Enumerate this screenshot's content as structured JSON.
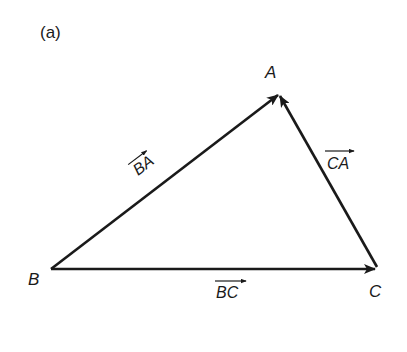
{
  "figure": {
    "panel_label": "(a)",
    "colors": {
      "stroke": "#1a1a1a",
      "background": "#ffffff"
    },
    "vertices": [
      {
        "name": "A",
        "x": 279,
        "y": 94
      },
      {
        "name": "B",
        "x": 51,
        "y": 269
      },
      {
        "name": "C",
        "x": 377,
        "y": 269
      }
    ],
    "vectors": [
      {
        "label": "BA",
        "from": "B",
        "to": "A"
      },
      {
        "label": "CA",
        "from": "C",
        "to": "A"
      },
      {
        "label": "BC",
        "from": "B",
        "to": "C"
      }
    ],
    "labels": {
      "A": "A",
      "B": "B",
      "C": "C",
      "BA": "BA",
      "CA": "CA",
      "BC": "BC"
    }
  }
}
